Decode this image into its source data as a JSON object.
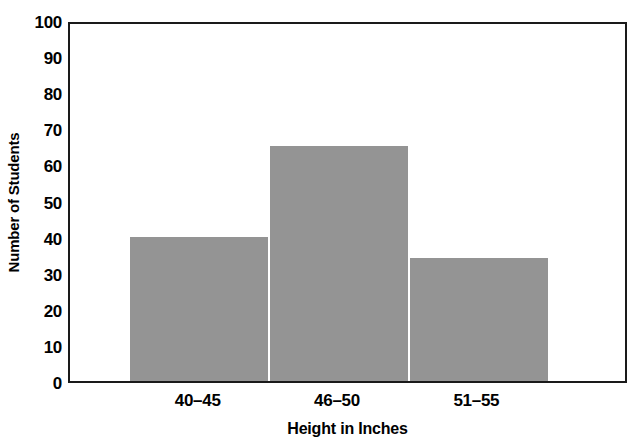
{
  "chart_data": {
    "type": "bar",
    "title": "",
    "subtitle": "",
    "xlabel": "Height in Inches",
    "ylabel": "Number of Students",
    "categories": [
      "40–45",
      "46–50",
      "51–55"
    ],
    "values": [
      40,
      65,
      34
    ],
    "series": [
      {
        "name": "Number of Students",
        "values": [
          40,
          65,
          34
        ]
      }
    ],
    "ylim": [
      0,
      100
    ],
    "ytick_labels": [
      "0",
      "10",
      "20",
      "30",
      "40",
      "50",
      "60",
      "70",
      "80",
      "90",
      "100"
    ],
    "ytick_values": [
      0,
      10,
      20,
      30,
      40,
      50,
      60,
      70,
      80,
      90,
      100
    ],
    "xtick_labels": [
      "40–45",
      "46–50",
      "51–55"
    ],
    "grid": false,
    "legend": false,
    "legend_position": "none",
    "annotations": [],
    "colors": {
      "bar_fill": "#949494",
      "bar_separator": "#ffffff",
      "axis_line": "#1a1a1a",
      "text": "#000000",
      "background": "#ffffff"
    }
  }
}
